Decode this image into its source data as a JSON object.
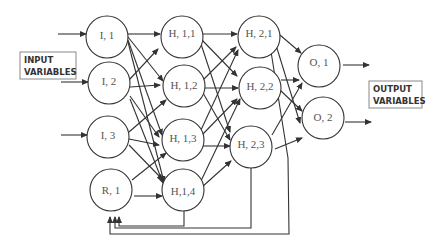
{
  "diagram": {
    "input_box": {
      "line1": "INPUT",
      "line2": "VARIABLES"
    },
    "output_box": {
      "line1": "OUTPUT",
      "line2": "VARIABLES"
    },
    "nodes": {
      "I1": "I, 1",
      "I2": "I, 2",
      "I3": "I, 3",
      "R1": "R, 1",
      "H11": "H, 1,1",
      "H12": "H, 1,2",
      "H13": "H, 1,3",
      "H14": "H,1,4",
      "H21": "H, 2,1",
      "H22": "H, 2,2",
      "H23": "H, 2,3",
      "O1": "O, 1",
      "O2": "O, 2"
    },
    "layers": [
      {
        "name": "input",
        "nodes": [
          "I, 1",
          "I, 2",
          "I, 3",
          "R, 1"
        ]
      },
      {
        "name": "hidden-1",
        "nodes": [
          "H, 1,1",
          "H, 1,2",
          "H, 1,3",
          "H,1,4"
        ]
      },
      {
        "name": "hidden-2",
        "nodes": [
          "H, 2,1",
          "H, 2,2",
          "H, 2,3"
        ]
      },
      {
        "name": "output",
        "nodes": [
          "O, 1",
          "O, 2"
        ]
      }
    ],
    "feedback_edges": [
      "H,1,4 -> R, 1",
      "H, 2,3 -> R, 1",
      "H, 2,1 -> R, 1"
    ],
    "colors": {
      "stroke": "#333333",
      "text": "#555555",
      "box_border": "#888888"
    }
  }
}
